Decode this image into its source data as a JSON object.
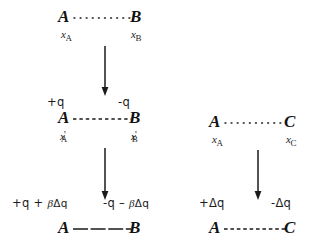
{
  "figure": {
    "ink_color": "#111111",
    "background": "#ffffff"
  },
  "columns": [
    {
      "name": "left-column",
      "rows": [
        {
          "name": "row-initial-ab",
          "bond_style": "dotted",
          "left_atom": "A",
          "right_atom": "B",
          "left_charge": "",
          "right_charge": "",
          "left_coord_base": "x",
          "left_coord_prime": "",
          "left_coord_sub": "A",
          "right_coord_base": "x",
          "right_coord_prime": "",
          "right_coord_sub": "B"
        },
        {
          "name": "row-intermediate-ab",
          "bond_style": "dashed",
          "left_atom": "A",
          "right_atom": "B",
          "left_charge": "+q",
          "right_charge": "-q",
          "left_coord_base": "x",
          "left_coord_prime": "'",
          "left_coord_sub": "A",
          "right_coord_base": "x",
          "right_coord_prime": "'",
          "right_coord_sub": "B"
        },
        {
          "name": "row-final-ab",
          "bond_style": "long-dash",
          "left_atom": "A",
          "right_atom": "B",
          "left_charge": "+q + βΔq",
          "right_charge": "-q – βΔq",
          "left_coord_base": "",
          "left_coord_prime": "",
          "left_coord_sub": "",
          "right_coord_base": "",
          "right_coord_prime": "",
          "right_coord_sub": ""
        }
      ],
      "arrows": [
        {
          "name": "arrow-initial-to-intermediate"
        },
        {
          "name": "arrow-intermediate-to-final"
        }
      ]
    },
    {
      "name": "right-column",
      "rows": [
        {
          "name": "row-initial-ac",
          "bond_style": "dotted",
          "left_atom": "A",
          "right_atom": "C",
          "left_charge": "",
          "right_charge": "",
          "left_coord_base": "x",
          "left_coord_prime": "",
          "left_coord_sub": "A",
          "right_coord_base": "x",
          "right_coord_prime": "",
          "right_coord_sub": "C"
        },
        {
          "name": "row-final-ac",
          "bond_style": "dashed",
          "left_atom": "A",
          "right_atom": "C",
          "left_charge": "+Δq",
          "right_charge": "-Δq",
          "left_coord_base": "",
          "left_coord_prime": "",
          "left_coord_sub": "",
          "right_coord_base": "",
          "right_coord_prime": "",
          "right_coord_sub": ""
        }
      ],
      "arrows": [
        {
          "name": "arrow-ac-initial-to-final"
        }
      ]
    }
  ],
  "labels": {
    "left_top_atom_a": "A",
    "left_top_atom_b": "B",
    "left_top_coord_a_base": "x",
    "left_top_coord_a_sub": "A",
    "left_top_coord_b_base": "x",
    "left_top_coord_b_sub": "B",
    "left_mid_charge_plus": "+q",
    "left_mid_charge_minus": "-q",
    "left_mid_atom_a": "A",
    "left_mid_atom_b": "B",
    "left_mid_coord_a_base": "x",
    "left_mid_coord_a_prime": "'",
    "left_mid_coord_a_sub": "A",
    "left_mid_coord_b_base": "x",
    "left_mid_coord_b_prime": "'",
    "left_mid_coord_b_sub": "B",
    "left_bot_charge_plus_pre": "+q + ",
    "left_bot_charge_plus_beta": "β",
    "left_bot_charge_plus_post": "Δq",
    "left_bot_charge_minus_pre": "-q – ",
    "left_bot_charge_minus_beta": "β",
    "left_bot_charge_minus_post": "Δq",
    "left_bot_atom_a": "A",
    "left_bot_atom_b": "B",
    "right_top_atom_a": "A",
    "right_top_atom_c": "C",
    "right_top_coord_a_base": "x",
    "right_top_coord_a_sub": "A",
    "right_top_coord_c_base": "x",
    "right_top_coord_c_sub": "C",
    "right_bot_charge_plus": "+Δq",
    "right_bot_charge_minus": "-Δq",
    "right_bot_atom_a": "A",
    "right_bot_atom_c": "C"
  }
}
